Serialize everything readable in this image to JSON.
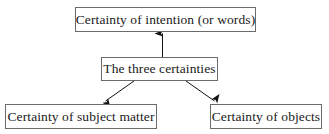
{
  "diagram": {
    "title": "The three certainties",
    "type": "hierarchy",
    "background_color": "#ffffff",
    "border_color": "#6b6b6b",
    "text_color": "#1a1a1a",
    "arrow_color": "#111111",
    "nodes": [
      {
        "id": "three-certainties",
        "label": "The three certainties",
        "role": "root"
      },
      {
        "id": "intention",
        "label": "Certainty of intention (or words)",
        "role": "child"
      },
      {
        "id": "subject-matter",
        "label": "Certainty of subject matter",
        "role": "child"
      },
      {
        "id": "objects",
        "label": "Certainty of objects",
        "role": "child"
      }
    ],
    "edges": [
      {
        "from": "three-certainties",
        "to": "intention",
        "direction": "up"
      },
      {
        "from": "three-certainties",
        "to": "subject-matter",
        "direction": "down-left"
      },
      {
        "from": "three-certainties",
        "to": "objects",
        "direction": "down-right"
      }
    ]
  }
}
